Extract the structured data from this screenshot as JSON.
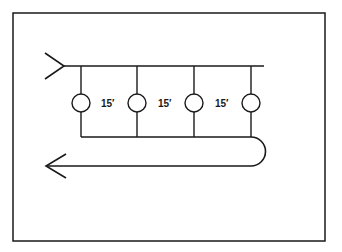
{
  "diagram": {
    "type": "manifold-loop",
    "stroke_color": "#1a1a1a",
    "background": "#ffffff",
    "spacing_labels": [
      "15′",
      "15′",
      "15′"
    ],
    "branch_count": 4,
    "inlet_arrow": "arrow-in-left",
    "return_arrow": "arrow-out-left"
  }
}
